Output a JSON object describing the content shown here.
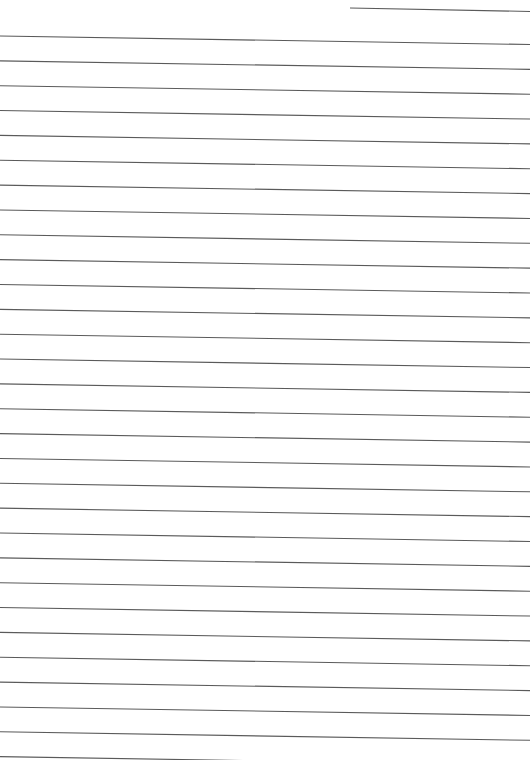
{
  "page": {
    "type": "lined-paper",
    "width": 530,
    "height": 760,
    "background": "#ffffff",
    "line_color": "#5a5a5a",
    "line_width": 1.1
  },
  "header_line": {
    "x1": 350,
    "y1": 8,
    "x2": 530,
    "y2": 11.5
  },
  "ruled_lines": {
    "count": 30,
    "first_left_y": 36,
    "spacing": 24.85,
    "slope_drop": 8.5,
    "x_start": 0,
    "x_end": 530
  }
}
